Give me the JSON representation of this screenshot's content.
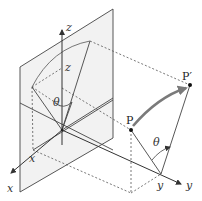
{
  "diagram": {
    "type": "3d-rotation-geometry",
    "axes": {
      "x": {
        "label": "x"
      },
      "y": {
        "label": "y"
      },
      "z": {
        "label": "z"
      }
    },
    "coordinate_markers": {
      "x": "x",
      "y": "y",
      "z": "z"
    },
    "points": {
      "P": "P",
      "P_prime": "P′"
    },
    "angles": {
      "theta_left": "θ",
      "theta_right": "θ"
    },
    "colors": {
      "plane_fill": "#f2f2f2",
      "line": "#444444",
      "dashed": "#555555",
      "arc_arrow": "#7a7a7a",
      "point": "#111111"
    }
  }
}
